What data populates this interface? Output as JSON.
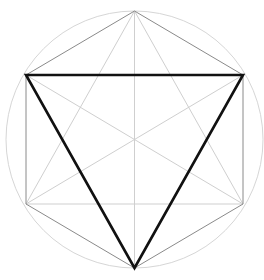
{
  "diagram": {
    "type": "geometric-construction",
    "center": [
      134.5,
      139.5
    ],
    "radius": 128.5,
    "colors": {
      "background": "#ffffff",
      "circle": "#d6d6d6",
      "hexagon": "#8a8a8a",
      "diagonals": "#cfcfcf",
      "triangle": "#111111"
    },
    "hexagon_vertices": [
      [
        134.5,
        11
      ],
      [
        243,
        75
      ],
      [
        243,
        204
      ],
      [
        134.5,
        268
      ],
      [
        26,
        204
      ],
      [
        26,
        75
      ]
    ],
    "triangle_vertices": [
      [
        26,
        75
      ],
      [
        243,
        75
      ],
      [
        134.5,
        268
      ]
    ]
  }
}
